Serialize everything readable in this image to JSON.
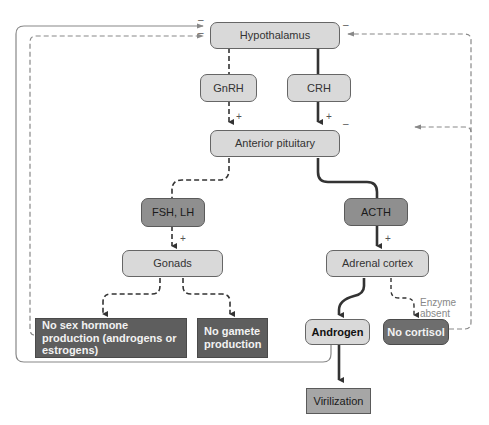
{
  "nodes": {
    "hypothalamus": "Hypothalamus",
    "gnrh": "GnRH",
    "crh": "CRH",
    "anterior_pituitary": "Anterior pituitary",
    "fsh_lh": "FSH, LH",
    "acth": "ACTH",
    "gonads": "Gonads",
    "adrenal_cortex": "Adrenal cortex",
    "no_sex_hormone": "No sex hormone production (androgens or estrogens)",
    "no_gamete": "No gamete production",
    "androgen": "Androgen",
    "no_cortisol": "No cortisol",
    "virilization": "Virilization"
  },
  "labels": {
    "plus": "+",
    "minus": "–",
    "enzyme_absent_line1": "Enzyme",
    "enzyme_absent_line2": "absent"
  },
  "colors": {
    "light_box": "#d9d9d9",
    "mid_box": "#8f8f8f",
    "dark_box": "#5e5e5e",
    "arrow_dark": "#333333",
    "arrow_feedback": "#888888"
  }
}
